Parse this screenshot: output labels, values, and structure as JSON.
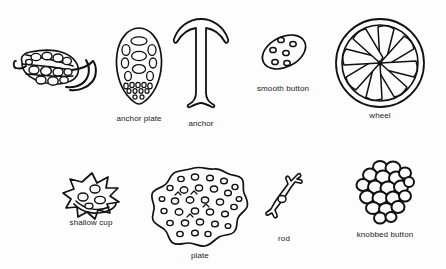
{
  "plate": {
    "title": "Holothurian ossicle types",
    "background_color": "#fdfdfd",
    "ink_color": "#111111",
    "figure_count": 9,
    "labeled_count": 8,
    "rows": 2
  },
  "figures": [
    {
      "id": "anchor-with-plate",
      "label": "",
      "shape": "composite anchor and perforated plate, oblique view",
      "x": 52,
      "y": 65,
      "caption_x": 0,
      "caption_y": 0,
      "has_caption": false
    },
    {
      "id": "anchor-plate",
      "label": "anchor plate",
      "shape": "teardrop plate with large ovate perforations and small basal pores",
      "x": 139,
      "y": 67,
      "caption_x": 139,
      "caption_y": 114,
      "has_caption": true
    },
    {
      "id": "anchor",
      "label": "anchor",
      "shape": "T-shaped anchor with recurved flukes and flared stock",
      "x": 201,
      "y": 60,
      "caption_x": 201,
      "caption_y": 119,
      "has_caption": true
    },
    {
      "id": "smooth-button",
      "label": "smooth button",
      "shape": "tilted oval button with six round perforations",
      "x": 283,
      "y": 52,
      "caption_x": 283,
      "caption_y": 84,
      "has_caption": true
    },
    {
      "id": "wheel",
      "label": "wheel",
      "shape": "circular wheel with double rim and eight radiating spokes",
      "x": 380,
      "y": 62,
      "caption_x": 380,
      "caption_y": 111,
      "has_caption": true
    },
    {
      "id": "shallow-cup",
      "label": "shallow cup",
      "shape": "spinose shallow cup with perforated floor and curved rim",
      "x": 91,
      "y": 196,
      "caption_x": 91,
      "caption_y": 218,
      "has_caption": true
    },
    {
      "id": "plate",
      "label": "plate",
      "shape": "irregular rounded plate with numerous round perforations",
      "x": 200,
      "y": 208,
      "caption_x": 200,
      "caption_y": 251,
      "has_caption": true
    },
    {
      "id": "rod",
      "label": "rod",
      "shape": "slender curved rod with forked ends and central perforation",
      "x": 284,
      "y": 200,
      "caption_x": 284,
      "caption_y": 234,
      "has_caption": true
    },
    {
      "id": "knobbed-button",
      "label": "knobbed button",
      "shape": "ovate button covered with rounded knobs",
      "x": 385,
      "y": 192,
      "caption_x": 385,
      "caption_y": 230,
      "has_caption": true
    }
  ]
}
